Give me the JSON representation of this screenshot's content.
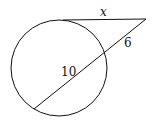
{
  "diagram": {
    "type": "circle-tangent-secant",
    "circle": {
      "cx": 59,
      "cy": 68,
      "r": 48
    },
    "external_point": {
      "x": 146,
      "y": 19
    },
    "tangent_point": {
      "x": 63,
      "y": 20
    },
    "secant_near": {
      "x": 105,
      "y": 53
    },
    "secant_far": {
      "x": 34,
      "y": 109
    },
    "labels": {
      "tangent": "x",
      "external_secant": "6",
      "internal_chord": "10"
    },
    "stroke_color": "#111111"
  }
}
